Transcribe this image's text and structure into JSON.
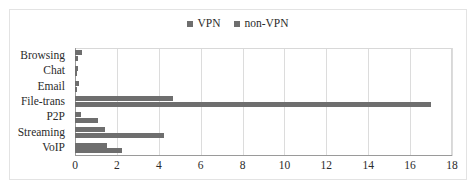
{
  "chart_data": {
    "type": "bar",
    "orientation": "horizontal",
    "title": "",
    "subtitle": "",
    "xlabel": "",
    "ylabel": "",
    "categories": [
      "Browsing",
      "Chat",
      "Email",
      "File-trans",
      "P2P",
      "Streaming",
      "VoIP"
    ],
    "series": [
      {
        "name": "VPN",
        "color": "#6e6e6e",
        "values": [
          0.35,
          0.15,
          0.18,
          4.7,
          0.3,
          1.45,
          1.55
        ]
      },
      {
        "name": "non-VPN",
        "color": "#6e6e6e",
        "values": [
          0.15,
          0.1,
          0.1,
          17.0,
          1.1,
          4.25,
          2.25
        ]
      }
    ],
    "xlim": [
      0,
      18
    ],
    "xticks": [
      0,
      2,
      4,
      6,
      8,
      10,
      12,
      14,
      16,
      18
    ],
    "xtick_labels": [
      "0",
      "2",
      "4",
      "6",
      "8",
      "10",
      "12",
      "14",
      "16",
      "18"
    ],
    "grid": "vertical",
    "gridline_color": "#dcdcdc",
    "legend": {
      "position": "top-center",
      "entries": [
        {
          "label": "VPN",
          "color": "#6e6e6e",
          "marker": "square-swatch"
        },
        {
          "label": "non-VPN",
          "color": "#6e6e6e",
          "marker": "square-swatch"
        }
      ]
    },
    "plot_background": "#ffffff",
    "axis_color": "#9a9a9a",
    "frame_color": "#e3e3e3"
  }
}
